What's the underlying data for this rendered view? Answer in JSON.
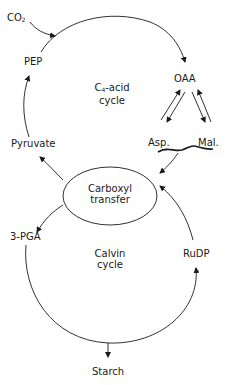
{
  "diagram": {
    "type": "metabolic-pathway",
    "nodes": {
      "co2": {
        "label": "CO",
        "sub": "2"
      },
      "pep": {
        "label": "PEP"
      },
      "oaa": {
        "label": "OAA"
      },
      "pyruvate": {
        "label": "Pyruvate"
      },
      "asp": {
        "label": "Asp."
      },
      "mal": {
        "label": "Mal."
      },
      "carboxyl_transfer": {
        "line1": "Carboxyl",
        "line2": "transfer"
      },
      "pga": {
        "label": "3-PGA"
      },
      "rudp": {
        "label": "RuDP"
      },
      "starch": {
        "label": "Starch"
      }
    },
    "cycles": {
      "c4": {
        "prefix": "C",
        "sub": "4",
        "suffix": "-acid",
        "line2": "cycle"
      },
      "calvin": {
        "line1": "Calvin",
        "line2": "cycle"
      }
    },
    "edges": [
      {
        "from": "CO2",
        "to": "PEP-OAA arc"
      },
      {
        "from": "PEP",
        "to": "OAA"
      },
      {
        "from": "OAA",
        "to": "Asp.",
        "reversible": true
      },
      {
        "from": "OAA",
        "to": "Mal.",
        "reversible": true
      },
      {
        "from": "Asp./Mal.",
        "to": "Carboxyl transfer"
      },
      {
        "from": "Carboxyl transfer",
        "to": "Pyruvate"
      },
      {
        "from": "Pyruvate",
        "to": "PEP"
      },
      {
        "from": "Carboxyl transfer",
        "to": "3-PGA"
      },
      {
        "from": "3-PGA",
        "to": "RuDP"
      },
      {
        "from": "Calvin cycle",
        "to": "Starch"
      },
      {
        "from": "RuDP",
        "to": "Carboxyl transfer"
      }
    ]
  }
}
